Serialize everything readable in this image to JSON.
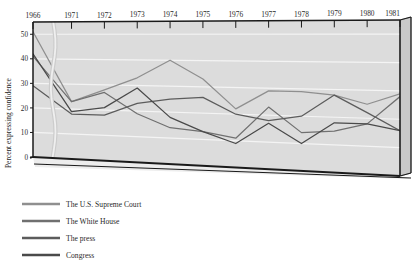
{
  "chart_data": {
    "type": "line",
    "title": "",
    "subtitle": "",
    "xlabel": "",
    "ylabel": "Percent expressing confidence",
    "x": [
      "1966",
      "1971",
      "1972",
      "1973",
      "1974",
      "1975",
      "1976",
      "1977",
      "1978",
      "1979",
      "1980",
      "1981"
    ],
    "x_tick_labels": [
      "1966",
      "1971",
      "1972",
      "1973",
      "1974",
      "1975",
      "1976",
      "1977",
      "1978",
      "1979",
      "1980",
      "1981"
    ],
    "y_tick_labels": [
      "0",
      "10",
      "20",
      "30",
      "40",
      "50"
    ],
    "y_ticks": [
      0,
      10,
      20,
      30,
      40,
      50
    ],
    "ylim": [
      0,
      55
    ],
    "grid": true,
    "grid_orientation": "horizontal",
    "legend_position": "below-left",
    "axis_break": "wavy break between 1966 and 1971",
    "series": [
      {
        "name": "The U.S. Supreme Court",
        "color": "#8f8f8f",
        "values": [
          51,
          23,
          28,
          33,
          40,
          33,
          22,
          29,
          29,
          28,
          25,
          29
        ]
      },
      {
        "name": "The White House",
        "color": "#707070",
        "values": [
          41,
          23,
          27,
          19,
          14,
          13,
          11,
          23,
          14,
          15,
          18,
          28
        ]
      },
      {
        "name": "The press",
        "color": "#5c5c5c",
        "values": [
          29,
          18,
          18,
          23,
          25,
          26,
          20,
          18,
          20,
          28,
          22,
          16
        ]
      },
      {
        "name": "Congress",
        "color": "#4a4a4a",
        "values": [
          42,
          19,
          21,
          29,
          18,
          13,
          9,
          17,
          10,
          18,
          18,
          16
        ]
      }
    ]
  },
  "legend": {
    "items": [
      {
        "label": "The U.S. Supreme Court",
        "color": "#8f8f8f"
      },
      {
        "label": "The White House",
        "color": "#707070"
      },
      {
        "label": "The press",
        "color": "#5c5c5c"
      },
      {
        "label": "Congress",
        "color": "#4a4a4a"
      }
    ]
  },
  "axes": {
    "y_title": "Percent expressing confidence"
  },
  "style": {
    "plot_face": "#dcdcdc",
    "plot_side": "#c9c9c9",
    "grid_color": "#f4f4f4",
    "axis_color": "#1a1a1a",
    "background": "#ffffff"
  }
}
